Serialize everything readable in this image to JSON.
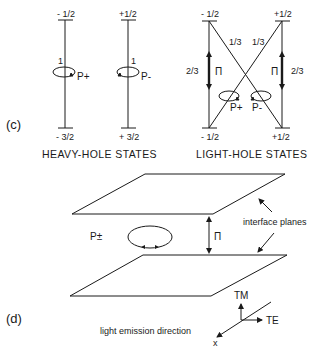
{
  "panel_c": {
    "label": "(c)",
    "heavy_hole": {
      "caption": "HEAVY-HOLE STATES",
      "left": {
        "top": "- 1/2",
        "bottom": "- 3/2",
        "strength": "1",
        "polarization": "P+"
      },
      "right": {
        "top": "+1/2",
        "bottom": "+ 3/2",
        "strength": "1",
        "polarization": "P-"
      }
    },
    "light_hole": {
      "caption": "LIGHT-HOLE STATES",
      "left": {
        "top": "- 1/2",
        "bottom": "- 1/2",
        "vertical_strength": "2/3",
        "vertical_polarization": "Π",
        "diagonal_strength": "1/3"
      },
      "right": {
        "top": "+1/2",
        "bottom": "+1/2",
        "vertical_strength": "2/3",
        "vertical_polarization": "Π",
        "diagonal_strength": "1/3"
      },
      "circular": {
        "left": "P+",
        "right": "P-"
      }
    }
  },
  "panel_d": {
    "label": "(d)",
    "planes_label": "interface planes",
    "circular_label": "P±",
    "pi_label": "Π",
    "axes": {
      "up": "TM",
      "right": "TE",
      "out": "x",
      "out_caption": "light emission direction"
    }
  }
}
